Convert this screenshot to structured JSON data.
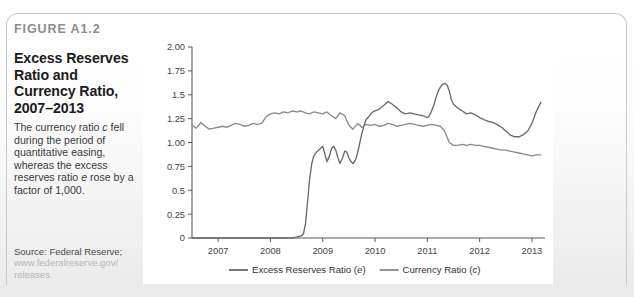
{
  "figure": {
    "number_label": "FIGURE A1.2",
    "title": "Excess Reserves Ratio and Currency Ratio, 2007–2013",
    "caption_part1": "The currency ratio ",
    "caption_italic1": "c",
    "caption_part2": " fell during the period of quantitative easing, whereas the excess reserves ratio ",
    "caption_italic2": "e",
    "caption_part3": " rose by a factor of 1,000.",
    "source_line1": "Source: Federal Reserve;",
    "source_line2": "www.federalreserve.gov/",
    "source_line3": "releases."
  },
  "colors": {
    "series_excess": "#6b6b6b",
    "series_currency": "#8a8a8a",
    "axis": "#5a5a5a",
    "panel_bg": "#ffffff",
    "page_bg": "#f1f1f1",
    "frame_border": "#c9c9c9",
    "figure_number": "#8d8d8d",
    "url_text": "#b6b6b6"
  },
  "chart_data": {
    "type": "line",
    "title": "Excess Reserves Ratio and Currency Ratio, 2007–2013",
    "xlabel": "",
    "ylabel": "",
    "grid": false,
    "legend_position": "bottom",
    "xlim": [
      2006.5,
      2013.25
    ],
    "ylim": [
      0,
      2.0
    ],
    "ytick_labels": [
      "2.00",
      "1.75",
      "1.5",
      "1.25",
      "1.00",
      "0.75",
      "0.5",
      "0.25",
      "0"
    ],
    "ytick_values": [
      2.0,
      1.75,
      1.5,
      1.25,
      1.0,
      0.75,
      0.5,
      0.25,
      0
    ],
    "xtick_labels": [
      "2007",
      "2008",
      "2009",
      "2010",
      "2011",
      "2012",
      "2013"
    ],
    "xtick_values": [
      2007,
      2008,
      2009,
      2010,
      2011,
      2012,
      2013
    ],
    "series": [
      {
        "name": "Excess Reserves Ratio (e)",
        "legend_label": "Excess Reserves Ratio (e)",
        "symbol": "e",
        "color": "#6b6b6b",
        "x": [
          2006.5,
          2006.58,
          2006.67,
          2006.75,
          2006.83,
          2006.92,
          2007.0,
          2007.08,
          2007.17,
          2007.25,
          2007.33,
          2007.42,
          2007.5,
          2007.58,
          2007.67,
          2007.75,
          2007.83,
          2007.92,
          2008.0,
          2008.08,
          2008.17,
          2008.25,
          2008.33,
          2008.42,
          2008.5,
          2008.58,
          2008.63,
          2008.67,
          2008.71,
          2008.75,
          2008.79,
          2008.83,
          2008.88,
          2008.92,
          2008.96,
          2009.0,
          2009.04,
          2009.08,
          2009.13,
          2009.17,
          2009.21,
          2009.25,
          2009.29,
          2009.33,
          2009.38,
          2009.42,
          2009.46,
          2009.5,
          2009.54,
          2009.58,
          2009.63,
          2009.67,
          2009.71,
          2009.75,
          2009.79,
          2009.83,
          2009.88,
          2009.92,
          2009.96,
          2010.0,
          2010.08,
          2010.17,
          2010.25,
          2010.33,
          2010.42,
          2010.5,
          2010.58,
          2010.67,
          2010.75,
          2010.83,
          2010.92,
          2011.0,
          2011.04,
          2011.08,
          2011.13,
          2011.17,
          2011.21,
          2011.25,
          2011.29,
          2011.33,
          2011.38,
          2011.42,
          2011.46,
          2011.5,
          2011.58,
          2011.67,
          2011.75,
          2011.83,
          2011.92,
          2012.0,
          2012.08,
          2012.17,
          2012.25,
          2012.33,
          2012.42,
          2012.5,
          2012.58,
          2012.67,
          2012.75,
          2012.83,
          2012.92,
          2013.0,
          2013.08,
          2013.17
        ],
        "y": [
          0.0,
          0.0,
          0.0,
          0.0,
          0.0,
          0.0,
          0.0,
          0.0,
          0.0,
          0.0,
          0.0,
          0.0,
          0.0,
          0.0,
          0.0,
          0.0,
          0.0,
          0.0,
          0.0,
          0.0,
          0.0,
          0.0,
          0.0,
          0.0,
          0.01,
          0.02,
          0.04,
          0.15,
          0.38,
          0.62,
          0.78,
          0.86,
          0.9,
          0.92,
          0.94,
          0.96,
          0.88,
          0.8,
          0.86,
          0.94,
          0.96,
          0.92,
          0.84,
          0.78,
          0.84,
          0.91,
          0.9,
          0.84,
          0.8,
          0.78,
          0.82,
          0.9,
          1.0,
          1.1,
          1.18,
          1.24,
          1.27,
          1.3,
          1.32,
          1.33,
          1.35,
          1.39,
          1.43,
          1.4,
          1.36,
          1.32,
          1.3,
          1.31,
          1.3,
          1.29,
          1.28,
          1.26,
          1.28,
          1.33,
          1.4,
          1.48,
          1.54,
          1.58,
          1.61,
          1.62,
          1.6,
          1.54,
          1.45,
          1.4,
          1.36,
          1.33,
          1.3,
          1.31,
          1.29,
          1.26,
          1.24,
          1.22,
          1.21,
          1.19,
          1.16,
          1.12,
          1.08,
          1.06,
          1.06,
          1.08,
          1.12,
          1.2,
          1.32,
          1.42
        ]
      },
      {
        "name": "Currency Ratio (c)",
        "legend_label": "Currency Ratio (c)",
        "symbol": "c",
        "color": "#8a8a8a",
        "x": [
          2006.5,
          2006.58,
          2006.67,
          2006.75,
          2006.83,
          2006.92,
          2007.0,
          2007.08,
          2007.17,
          2007.25,
          2007.33,
          2007.42,
          2007.5,
          2007.58,
          2007.67,
          2007.75,
          2007.83,
          2007.92,
          2008.0,
          2008.08,
          2008.17,
          2008.25,
          2008.33,
          2008.42,
          2008.5,
          2008.58,
          2008.67,
          2008.75,
          2008.83,
          2008.92,
          2009.0,
          2009.08,
          2009.17,
          2009.25,
          2009.33,
          2009.42,
          2009.5,
          2009.58,
          2009.67,
          2009.75,
          2009.83,
          2009.92,
          2010.0,
          2010.08,
          2010.17,
          2010.25,
          2010.33,
          2010.42,
          2010.5,
          2010.58,
          2010.67,
          2010.75,
          2010.83,
          2010.92,
          2011.0,
          2011.08,
          2011.17,
          2011.25,
          2011.33,
          2011.42,
          2011.5,
          2011.58,
          2011.67,
          2011.75,
          2011.83,
          2011.92,
          2012.0,
          2012.08,
          2012.17,
          2012.25,
          2012.33,
          2012.42,
          2012.5,
          2012.58,
          2012.67,
          2012.75,
          2012.83,
          2012.92,
          2013.0,
          2013.08,
          2013.17
        ],
        "y": [
          1.18,
          1.15,
          1.21,
          1.17,
          1.14,
          1.15,
          1.16,
          1.17,
          1.16,
          1.18,
          1.2,
          1.19,
          1.17,
          1.18,
          1.2,
          1.19,
          1.2,
          1.27,
          1.3,
          1.31,
          1.3,
          1.32,
          1.31,
          1.33,
          1.32,
          1.33,
          1.31,
          1.3,
          1.32,
          1.31,
          1.3,
          1.32,
          1.28,
          1.25,
          1.31,
          1.28,
          1.18,
          1.14,
          1.2,
          1.16,
          1.19,
          1.18,
          1.19,
          1.17,
          1.18,
          1.2,
          1.19,
          1.17,
          1.18,
          1.19,
          1.2,
          1.19,
          1.18,
          1.17,
          1.18,
          1.19,
          1.18,
          1.17,
          1.12,
          1.0,
          0.97,
          0.97,
          0.98,
          0.97,
          0.98,
          0.97,
          0.97,
          0.96,
          0.95,
          0.94,
          0.93,
          0.92,
          0.92,
          0.91,
          0.9,
          0.89,
          0.88,
          0.87,
          0.86,
          0.87,
          0.87
        ]
      }
    ]
  }
}
